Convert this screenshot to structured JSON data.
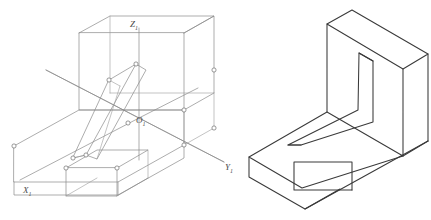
{
  "figure": {
    "background_color": "#ffffff",
    "width": 431,
    "height": 220,
    "line_color_wireframe": "#8a8a8a",
    "line_color_solid": "#3a3a3a",
    "vertex_marker_color": "#6f6f6f",
    "label_color": "#4a4a4a"
  },
  "views": [
    {
      "id": "left-wireframe-view",
      "name": "Wireframe isometric with auxiliary coordinate axes",
      "style": "wireframe-with-vertex-markers",
      "has_axes": true,
      "has_vertex_markers": true
    },
    {
      "id": "right-solid-view",
      "name": "Solid isometric view of the same part",
      "style": "solid-outline",
      "has_axes": false,
      "has_vertex_markers": false
    }
  ],
  "axes": {
    "origin": {
      "label": "O",
      "subscript": "1",
      "x": 139,
      "y": 118
    },
    "x_axis": {
      "label": "X",
      "subscript": "1",
      "x": 26,
      "y": 192,
      "direction": "down-left"
    },
    "y_axis": {
      "label": "Y",
      "subscript": "1",
      "x": 228,
      "y": 167,
      "direction": "down-right"
    },
    "z_axis": {
      "label": "Z",
      "subscript": "1",
      "x": 134,
      "y": 23,
      "direction": "up"
    }
  },
  "part": {
    "name": "L-shaped bracket",
    "features": [
      "horizontal base plate",
      "vertical back plate",
      "angled triangular rib",
      "rectangular notch in front face of base"
    ]
  },
  "caption_ghost": ""
}
